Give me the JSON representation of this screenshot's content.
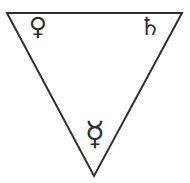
{
  "figure": {
    "name": "alchemical-inverted-triangle",
    "background_color": "#ffffff",
    "stroke_color": "#2f2f33",
    "stroke_width": "2"
  },
  "shape": {
    "name": "inverted-triangle",
    "orientation": "point-down",
    "vertices": {
      "top_left": {
        "x": 7,
        "y": 13
      },
      "top_right": {
        "x": 182,
        "y": 13
      },
      "bottom": {
        "x": 94,
        "y": 176
      }
    },
    "points_attr": "7,13 182,13 94,176"
  },
  "symbols": {
    "venus": {
      "label": "Venus",
      "glyph": "♀",
      "position": "top-left",
      "color": "#2f2f33"
    },
    "saturn": {
      "label": "Saturn",
      "glyph": "♄",
      "position": "top-right",
      "color": "#2f2f33"
    },
    "mercury": {
      "label": "Mercury",
      "glyph": "☿",
      "position": "bottom",
      "color": "#2f2f33"
    }
  }
}
